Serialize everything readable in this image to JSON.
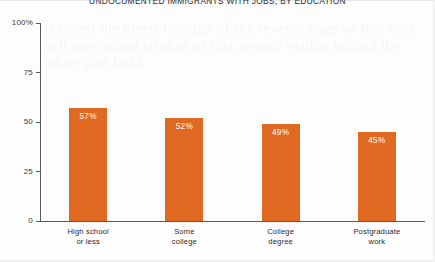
{
  "chart_data": {
    "type": "bar",
    "title": "UNDOCUMENTED IMMIGRANTS WITH JOBS, BY EDUCATION",
    "categories": [
      "High school or less",
      "Some college",
      "College degree",
      "Postgraduate work"
    ],
    "category_lines": [
      [
        "High school",
        "or less"
      ],
      [
        "Some",
        "college"
      ],
      [
        "College",
        "degree"
      ],
      [
        "Postgraduate",
        "work"
      ]
    ],
    "values": [
      57,
      52,
      49,
      45
    ],
    "value_labels": [
      "57%",
      "52%",
      "49%",
      "45%"
    ],
    "xlabel": "",
    "ylabel": "",
    "ylim": [
      0,
      100
    ],
    "yticks": [
      0,
      25,
      50,
      75,
      100
    ],
    "ytick_labels": [
      "0",
      "25",
      "50",
      "75",
      "100%"
    ],
    "grid": false,
    "legend": false,
    "bar_color": "#e06a22",
    "axis_color": "#5a5a5a",
    "label_color": "#ffffff",
    "background": "#fdfdfd"
  },
  "watermark": {
    "text": "ts tinted the bleed-through of the reverse page so that only soft grey ghost strokes of text remain visible behind the white plot field"
  }
}
